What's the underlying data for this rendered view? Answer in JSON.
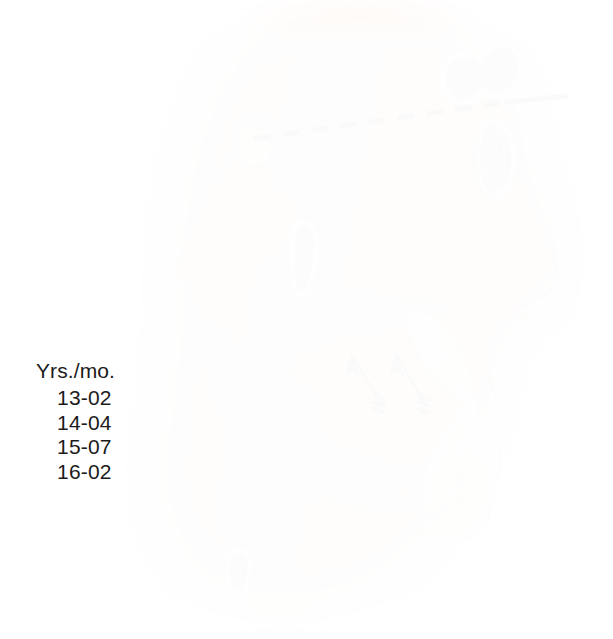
{
  "figure": {
    "background_color": "#ffffff"
  },
  "legend": {
    "name": "age-legend",
    "title": "Yrs./mo.",
    "entries": [
      {
        "label": "13-02",
        "years": 13,
        "months": 2
      },
      {
        "label": "14-04",
        "years": 14,
        "months": 4
      },
      {
        "label": "15-07",
        "years": 15,
        "months": 7
      },
      {
        "label": "16-02",
        "years": 16,
        "months": 2
      }
    ],
    "text_color": "#1b1b1b"
  },
  "annotations": {
    "reference_line": {
      "name": "reference-plane-line",
      "style": "dashed-then-solid",
      "color": "#111111",
      "description": "horizontal reference plane from sella region to glabella, dashed over the cranium and solid beyond the forehead",
      "dashed_from": [
        254,
        139
      ],
      "dashed_to": [
        512,
        101
      ],
      "solid_from": [
        508,
        101
      ],
      "solid_to": [
        567,
        96
      ]
    },
    "growth_arrows": [
      {
        "name": "growth-arrow-anterior",
        "color": "#1a1410",
        "direction": "up-and-back",
        "tail": [
          381,
          404
        ],
        "head": [
          352,
          356
        ],
        "has_crosshatch_tail": true
      },
      {
        "name": "growth-arrow-posterior",
        "color": "#1a1410",
        "direction": "up-and-back",
        "tail": [
          425,
          404
        ],
        "head": [
          396,
          355
        ],
        "has_crosshatch_tail": true
      }
    ]
  },
  "anatomy": {
    "soft_tissue_color": "#f0b294",
    "soft_tissue_shadow": "#e09c7c",
    "bone_color": "#e7c9a4",
    "bone_shadow": "#c9a87e",
    "cortical_line": "#a6835a",
    "tooth_color": "#f7f2e2",
    "tooth_shadow": "#ded6bd",
    "sinus_color": "#c0796a",
    "sinus_highlight": "#ffffff",
    "cartilage_color": "#b3ae7f",
    "structures": [
      {
        "name": "forehead-soft-tissue",
        "kind": "soft-tissue"
      },
      {
        "name": "nasal-dorsum",
        "kind": "soft-tissue"
      },
      {
        "name": "nose-tip",
        "kind": "soft-tissue"
      },
      {
        "name": "upper-lip",
        "kind": "soft-tissue"
      },
      {
        "name": "lower-lip",
        "kind": "soft-tissue"
      },
      {
        "name": "chin-soft-tissue",
        "kind": "soft-tissue"
      },
      {
        "name": "frontal-sinus",
        "kind": "sinus"
      },
      {
        "name": "ethmoid-air-cells",
        "kind": "sinus"
      },
      {
        "name": "nasal-septal-cartilage",
        "kind": "cartilage"
      },
      {
        "name": "maxilla",
        "kind": "bone"
      },
      {
        "name": "hard-palate",
        "kind": "bone"
      },
      {
        "name": "maxillary-sinus",
        "kind": "bone-cavity"
      },
      {
        "name": "mandible-body",
        "kind": "bone"
      },
      {
        "name": "mandibular-ramus",
        "kind": "bone"
      },
      {
        "name": "coronoid-process",
        "kind": "bone"
      },
      {
        "name": "mandibular-condyle",
        "kind": "bone"
      },
      {
        "name": "pterygoid-plate-vessel",
        "kind": "soft-tissue-marker"
      },
      {
        "name": "mental-foramen-marker",
        "kind": "soft-tissue-marker"
      },
      {
        "name": "upper-central-incisor",
        "kind": "tooth"
      },
      {
        "name": "lower-central-incisor",
        "kind": "tooth"
      },
      {
        "name": "trabecular-bone-stipple",
        "kind": "texture"
      }
    ]
  }
}
